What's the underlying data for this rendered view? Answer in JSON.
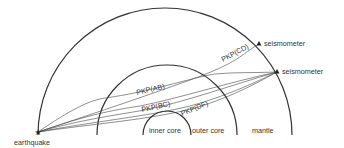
{
  "diagram": {
    "layers": [
      {
        "id": "inner_core",
        "label": "inner core"
      },
      {
        "id": "outer_core",
        "label": "outer core"
      },
      {
        "id": "mantle",
        "label": "mantle"
      }
    ],
    "source": {
      "label": "earthquake",
      "icon": "star-icon"
    },
    "stations": [
      {
        "label": "seismometer",
        "icon": "triangle-icon"
      },
      {
        "label": "seismometer",
        "icon": "triangle-icon"
      }
    ],
    "rays": [
      {
        "label": "PKP(CD)"
      },
      {
        "label": "PKP(AB)"
      },
      {
        "label": "PKP(BC)"
      },
      {
        "label": "PKP(DF)"
      }
    ],
    "colors": {
      "line": "#333333",
      "background": "#ffffff"
    }
  }
}
